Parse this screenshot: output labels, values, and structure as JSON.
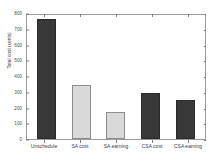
{
  "chart_data": {
    "type": "bar",
    "title": "",
    "xlabel": "",
    "ylabel": "Total cost (cents)",
    "categories": [
      "Unschedule",
      "SA cost",
      "SA earning",
      "CSA cost",
      "CSA earning"
    ],
    "values": [
      765,
      340,
      170,
      290,
      248
    ],
    "bar_colors": [
      "#383838",
      "#d9d9d9",
      "#d9d9d9",
      "#383838",
      "#383838"
    ],
    "ylim": [
      0,
      800
    ],
    "yticks": [
      0,
      100,
      200,
      300,
      400,
      500,
      600,
      700,
      800
    ],
    "ytick_labels": [
      "0",
      "100",
      "200",
      "300",
      "400",
      "500",
      "600",
      "700",
      "800"
    ],
    "grid": false,
    "legend": null,
    "axis_color": "#9a9a9a",
    "background": "#ffffff"
  }
}
